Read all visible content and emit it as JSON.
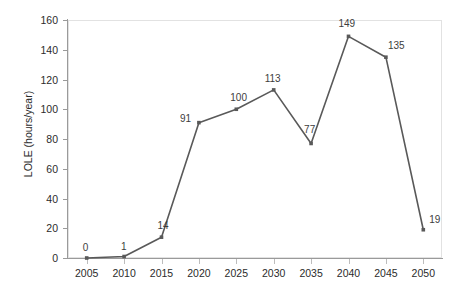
{
  "chart_data": {
    "type": "line",
    "title": "",
    "xlabel": "",
    "ylabel": "LOLE (hours/year)",
    "categories": [
      "2005",
      "2010",
      "2015",
      "2020",
      "2025",
      "2030",
      "2035",
      "2040",
      "2045",
      "2050"
    ],
    "x": [
      2005,
      2010,
      2015,
      2020,
      2025,
      2030,
      2035,
      2040,
      2045,
      2050
    ],
    "values": [
      0,
      1,
      14,
      91,
      100,
      113,
      77,
      149,
      135,
      19
    ],
    "data_labels": [
      "0",
      "1",
      "14",
      "91",
      "100",
      "113",
      "77",
      "149",
      "135",
      "19"
    ],
    "xlim": [
      2005,
      2050
    ],
    "ylim": [
      0,
      160
    ],
    "yticks": [
      0,
      20,
      40,
      60,
      80,
      100,
      120,
      140,
      160
    ],
    "ytick_labels": [
      "0",
      "20",
      "40",
      "60",
      "80",
      "100",
      "120",
      "140",
      "160"
    ],
    "xtick_labels": [
      "2005",
      "2010",
      "2015",
      "2020",
      "2025",
      "2030",
      "2035",
      "2040",
      "2045",
      "2050"
    ],
    "grid": false,
    "legend": false,
    "legend_position": "none",
    "series_color": "#595959",
    "marker": "square",
    "marker_color": "#595959",
    "label_color": "#3d3d3d",
    "axis_color": "#9a9a9a",
    "plot_border_color": "#e2e2e2",
    "background_color": "#ffffff"
  },
  "label_offsets": [
    {
      "dx": -4,
      "dy": -15
    },
    {
      "dx": -3,
      "dy": -15
    },
    {
      "dx": -4,
      "dy": -16
    },
    {
      "dx": -19,
      "dy": -9
    },
    {
      "dx": -6,
      "dy": -16
    },
    {
      "dx": -9,
      "dy": -16
    },
    {
      "dx": -7,
      "dy": -18
    },
    {
      "dx": -10,
      "dy": -17
    },
    {
      "dx": 2,
      "dy": -16
    },
    {
      "dx": 6,
      "dy": -15
    }
  ]
}
